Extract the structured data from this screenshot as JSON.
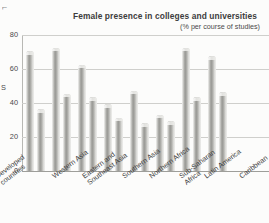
{
  "chart_data": {
    "type": "bar",
    "title": "Female presence in colleges and universities",
    "subtitle": "(% per course of studies)",
    "xlabel": "",
    "ylabel": "",
    "ylim": [
      0,
      80
    ],
    "yticks": [
      0,
      20,
      40,
      60,
      80
    ],
    "grid": true,
    "legend": "none",
    "categories": [
      "Developed countries",
      "Western Asia",
      "Eastern and Southeast Asia",
      "Southern Asia",
      "Northern Africa",
      "Sub-Saharan Africa",
      "Latin America",
      "Caribbean"
    ],
    "series": [
      {
        "name": "Series 1",
        "values": [
          70,
          72,
          62,
          39,
          47,
          33,
          72,
          67
        ]
      },
      {
        "name": "Series 2",
        "values": [
          36,
          45,
          43,
          31,
          28,
          29,
          43,
          46
        ]
      }
    ],
    "bars": [
      {
        "category": "Developed countries",
        "series": "Series 1",
        "value": 70
      },
      {
        "category": "Developed countries",
        "series": "Series 2",
        "value": 36
      },
      {
        "category": "Western Asia",
        "series": "Series 1",
        "value": 72
      },
      {
        "category": "Western Asia",
        "series": "Series 2",
        "value": 45
      },
      {
        "category": "Eastern and Southeast Asia",
        "series": "Series 1",
        "value": 62
      },
      {
        "category": "Eastern and Southeast Asia",
        "series": "Series 2",
        "value": 43
      },
      {
        "category": "Southern Asia",
        "series": "Series 1",
        "value": 39
      },
      {
        "category": "Southern Asia",
        "series": "Series 2",
        "value": 31
      },
      {
        "category": "Northern Africa",
        "series": "Series 1",
        "value": 47
      },
      {
        "category": "Northern Africa",
        "series": "Series 2",
        "value": 28
      },
      {
        "category": "Sub-Saharan Africa",
        "series": "Series 1",
        "value": 33
      },
      {
        "category": "Sub-Saharan Africa",
        "series": "Series 2",
        "value": 29
      },
      {
        "category": "Latin America",
        "series": "Series 1",
        "value": 72
      },
      {
        "category": "Latin America",
        "series": "Series 2",
        "value": 43
      },
      {
        "category": "Caribbean",
        "series": "Series 1",
        "value": 67
      },
      {
        "category": "Caribbean",
        "series": "Series 2",
        "value": 46
      }
    ],
    "bar_color": "#a5a5a1",
    "grid_color": "#cfcfcc",
    "background": "#fcfcfb"
  },
  "axis": {
    "y_tick_0": "0",
    "y_tick_20": "20",
    "y_tick_40": "40",
    "y_tick_60": "60",
    "y_tick_80": "80",
    "left_partial_text": "S"
  },
  "x_labels": {
    "l0": "Developed countries",
    "l1": "Western Asia",
    "l2": "Eastern and Southeast Asia",
    "l3": "Southern Asia",
    "l4": "Northern Africa",
    "l5": "Sub-Saharan Africa",
    "l6": "Latin America",
    "l7": "Caribbean"
  },
  "crop_mark": "⌐"
}
